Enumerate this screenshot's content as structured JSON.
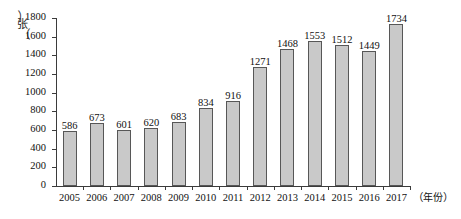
{
  "chart_data": {
    "type": "bar",
    "title": "",
    "subtitle": "",
    "xlabel": "（年份）",
    "ylabel": "（张）",
    "categories": [
      "2005",
      "2006",
      "2007",
      "2008",
      "2009",
      "2010",
      "2011",
      "2012",
      "2013",
      "2014",
      "2015",
      "2016",
      "2017"
    ],
    "values": [
      586,
      673,
      601,
      620,
      683,
      834,
      916,
      1271,
      1468,
      1553,
      1512,
      1449,
      1734
    ],
    "data_labels": [
      "586",
      "673",
      "601",
      "620",
      "683",
      "834",
      "916",
      "1271",
      "1468",
      "1553",
      "1512",
      "1449",
      "1734"
    ],
    "ylim": [
      0,
      1800
    ],
    "ytick_step": 200,
    "ytick_labels": [
      "0",
      "200",
      "400",
      "600",
      "800",
      "1000",
      "1200",
      "1400",
      "1600",
      "1800"
    ],
    "ytick_values": [
      0,
      200,
      400,
      600,
      800,
      1000,
      1200,
      1400,
      1600,
      1800
    ],
    "grid": false,
    "legend": false,
    "legend_position": "none",
    "bar_fill_color": "#c9c9c9",
    "bar_border_color": "#575757",
    "axis_color": "#3b3b3b",
    "text_color": "#111111"
  },
  "axis": {
    "y_label_paren_open": "︵",
    "y_label_char": "张",
    "y_label_paren_close": "︶",
    "x_label_open": "（",
    "x_label_char": "年份",
    "x_label_close": "）"
  }
}
